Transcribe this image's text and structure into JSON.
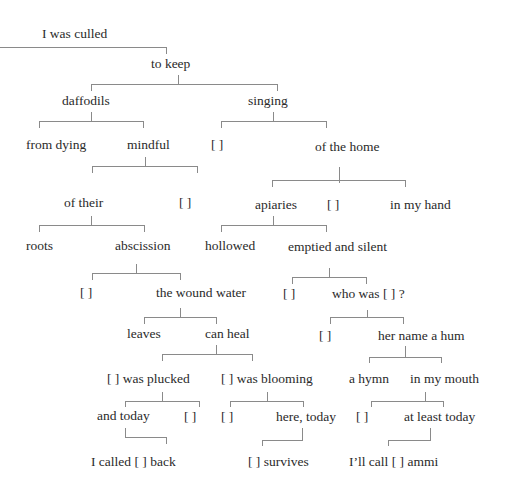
{
  "diagram": {
    "type": "syntax-tree-poem",
    "nodes": {
      "root": "I was culled",
      "to_keep": "to keep",
      "daffodils": "daffodils",
      "singing": "singing",
      "from_dying": "from dying",
      "mindful": "mindful",
      "blank_singing": "[    ]",
      "of_the_home": "of  the home",
      "of_their": "of  their",
      "blank_mindful": "[    ]",
      "apiaries": "apiaries",
      "blank_home": "[    ]",
      "in_my_hand": "in my hand",
      "roots": "roots",
      "abscission": "abscission",
      "hollowed": "hollowed",
      "emptied_and_silent": "emptied and silent",
      "blank_abscission": "[    ]",
      "the_wound_water": "the wound water",
      "blank_emptied": "[    ]",
      "who_was": "who was [   ] ?",
      "leaves": "leaves",
      "can_heal": "can heal",
      "blank_who": "[    ]",
      "her_name_a_hum": "her name a hum",
      "was_plucked": "[    ] was plucked",
      "was_blooming": "[    ] was blooming",
      "a_hymn": "a hymn",
      "in_my_mouth": "in my mouth",
      "and_today": "and today",
      "blank_plucked": "[    ]",
      "blank_blooming": "[    ]",
      "here_today": "here, today",
      "blank_mouth": "[    ]",
      "at_least_today": "at least today",
      "i_called_back": "I called [    ] back",
      "survives": "[    ] survives",
      "ill_call_ammi": "I’ll call [    ] ammi"
    }
  }
}
